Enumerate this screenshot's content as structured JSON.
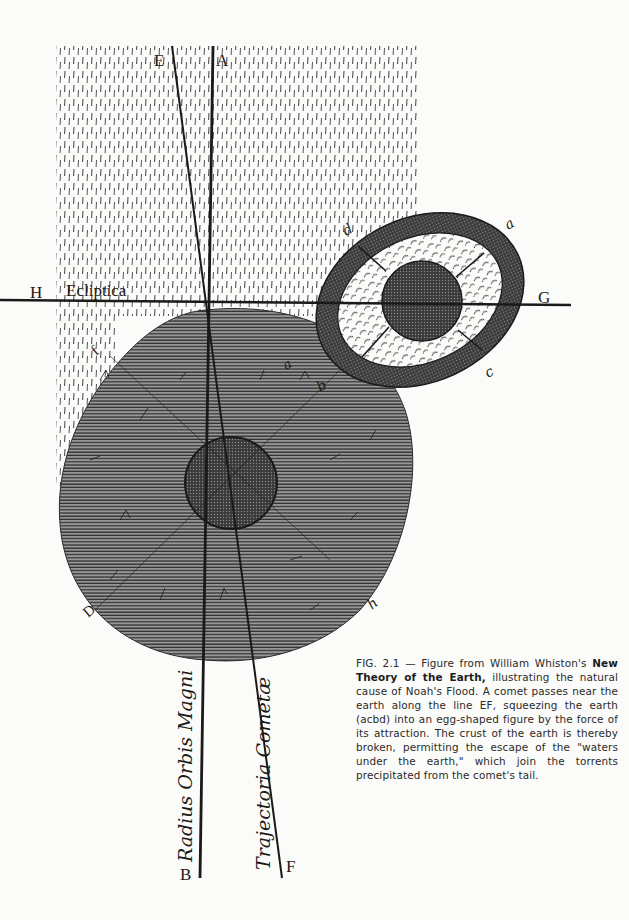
{
  "figure": {
    "labels": {
      "E": "E",
      "A": "A",
      "H": "H",
      "ecliptica": "Ecliptica",
      "G": "G",
      "d": "d",
      "a_outer": "a",
      "c": "c",
      "b": "b",
      "a_inner": "a",
      "f": "f",
      "D": "D",
      "h": "h",
      "B": "B",
      "F": "F",
      "radius_orbis_magni": "Radius Orbis Magni",
      "trajectoria_cometae": "Trajectoria Cometæ"
    },
    "colors": {
      "ink": "#1a1a1a",
      "paper": "#fbfbf9",
      "comet_shade": "#6d6d6d",
      "crust": "#2c2c2c"
    }
  },
  "caption": {
    "fig_number": "FIG. 2.1",
    "dash": " — Figure from William Whiston's ",
    "book_title": "New Theory of the Earth,",
    "body": " illustrating the natural cause of Noah's Flood. A comet passes near the earth along the line EF, squeezing the earth (acbd) into an egg-shaped figure by the force of its attraction. The crust of the earth is thereby broken, permitting the escape of the \"waters under the earth,\" which join the torrents precipitated from the comet's tail."
  }
}
